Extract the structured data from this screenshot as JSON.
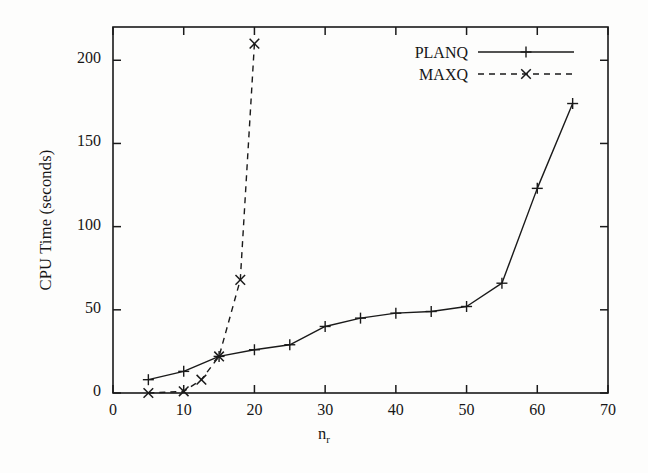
{
  "chart_data": {
    "type": "line",
    "title": "",
    "xlabel": "n_r",
    "xlabel_base": "n",
    "xlabel_sub": "r",
    "ylabel": "CPU Time (seconds)",
    "xlim": [
      0,
      70
    ],
    "ylim": [
      0,
      220
    ],
    "xticks": [
      0,
      10,
      20,
      30,
      40,
      50,
      60,
      70
    ],
    "xtick_labels": [
      "0",
      "10",
      "20",
      "30",
      "40",
      "50",
      "60",
      "70"
    ],
    "yticks": [
      0,
      50,
      100,
      150,
      200
    ],
    "ytick_labels": [
      "0",
      "50",
      "100",
      "150",
      "200"
    ],
    "grid": false,
    "legend_position": "top-right",
    "series": [
      {
        "name": "PLANQ",
        "marker": "plus",
        "linestyle": "solid",
        "color": "#1a1a1a",
        "x": [
          5,
          10,
          15,
          20,
          25,
          30,
          35,
          40,
          45,
          50,
          55,
          60,
          65
        ],
        "y": [
          8,
          13,
          22,
          26,
          29,
          40,
          45,
          48,
          49,
          52,
          66,
          123,
          174
        ]
      },
      {
        "name": "MAXQ",
        "marker": "cross",
        "linestyle": "dashed",
        "color": "#1a1a1a",
        "x": [
          5,
          10,
          12.5,
          15,
          18,
          20
        ],
        "y": [
          0,
          1,
          8,
          22,
          68,
          210
        ]
      }
    ]
  },
  "legend": {
    "entries": [
      {
        "label": "PLANQ",
        "style": "solid-plus"
      },
      {
        "label": "MAXQ",
        "style": "dashed-cross"
      }
    ]
  }
}
